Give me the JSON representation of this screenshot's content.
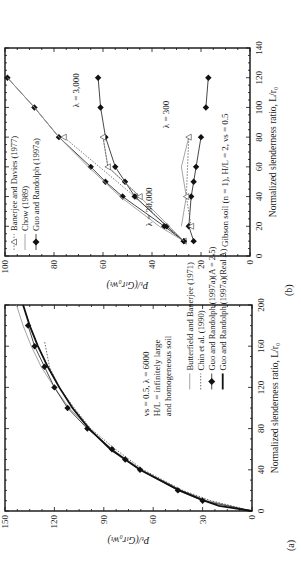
{
  "figure": {
    "panel_a_label": "(a)",
    "panel_b_label": "(b)"
  },
  "chart_data": [
    {
      "panel": "(a)",
      "type": "line",
      "title": "",
      "xlabel": "Normalized slenderness ratio, L/r0",
      "ylabel": "Pt/(GLr0wt)",
      "xlim": [
        0,
        200
      ],
      "ylim": [
        0,
        150
      ],
      "xticks": [
        0,
        40,
        80,
        120,
        160,
        200
      ],
      "yticks": [
        0,
        30,
        60,
        90,
        120,
        150
      ],
      "annotation": [
        "νs = 0.5, λ = 6000",
        "H/L = infinitely large",
        "and homogeneous soil"
      ],
      "legend_position": "lower right",
      "series": [
        {
          "name": "Butterfield and Banerjee (1971)",
          "style": "thin-gray",
          "x": [
            0,
            10,
            20,
            40,
            60,
            80,
            100,
            120,
            140,
            160,
            180,
            200
          ],
          "y": [
            0,
            27,
            43,
            67,
            85,
            99,
            111,
            120,
            128,
            134,
            139,
            143
          ]
        },
        {
          "name": "Chin et al. (1990)",
          "style": "dotted",
          "x": [
            0,
            10,
            20,
            40,
            60,
            80,
            100,
            120,
            140,
            165
          ],
          "y": [
            0,
            25,
            42,
            66,
            83,
            98,
            108,
            117,
            123,
            126
          ]
        },
        {
          "name": "Guo and Randolph (1997a)(A = 2.5)",
          "style": "line-diamond",
          "x": [
            0,
            10,
            20,
            40,
            50,
            60,
            80,
            100,
            120,
            140,
            160,
            180
          ],
          "y": [
            0,
            30,
            45,
            68,
            77,
            85,
            100,
            112,
            120,
            126,
            132,
            136
          ]
        },
        {
          "name": "Guo and Randolph (1997a)(Real A)",
          "style": "thick-black",
          "x": [
            0,
            5,
            10,
            20,
            40,
            60,
            80,
            100,
            120,
            140,
            160,
            180,
            200
          ],
          "y": [
            0,
            20,
            29,
            44,
            68,
            86,
            99,
            109,
            117,
            124,
            130,
            135,
            139
          ]
        }
      ]
    },
    {
      "panel": "(b)",
      "type": "line",
      "title": "",
      "xlabel": "Normalized slenderness ratio, L/r0",
      "ylabel": "Pt/(GLr0wt)",
      "xlim": [
        0,
        140
      ],
      "ylim": [
        0,
        100
      ],
      "xticks": [
        0,
        20,
        40,
        60,
        80,
        100,
        120,
        140
      ],
      "yticks": [
        0,
        20,
        40,
        60,
        80,
        100
      ],
      "annotation": "Gibson soil (n = 1), H/L = 2, νs = 0.5",
      "curve_labels": [
        "λ = 30,000",
        "λ = 3,000",
        "λ = 300"
      ],
      "legend_position": "upper left",
      "legend": [
        "Banerjee and Davies (1977)",
        "Chow (1989)",
        "Guo and Randolph (1997a)"
      ],
      "series": [
        {
          "name": "Guo and Randolph (1997a) λ=30,000",
          "style": "line-diamond",
          "x": [
            10,
            20,
            40,
            50,
            60,
            80,
            100,
            120
          ],
          "y": [
            27,
            35,
            52,
            59,
            65,
            78,
            88,
            99
          ]
        },
        {
          "name": "Chow (1989) λ=30,000",
          "style": "thin-gray",
          "x": [
            10,
            20,
            40,
            60,
            80,
            100,
            120
          ],
          "y": [
            27,
            37,
            53,
            66,
            78,
            88,
            99
          ]
        },
        {
          "name": "Banerjee and Davies (1977) λ=30,000",
          "style": "dotted-triangle",
          "x": [
            10,
            40,
            80
          ],
          "y": [
            27,
            47,
            76
          ]
        },
        {
          "name": "Guo and Randolph (1997a) λ=3,000",
          "style": "line-diamond",
          "x": [
            10,
            20,
            40,
            50,
            60,
            80,
            100,
            120
          ],
          "y": [
            27,
            34,
            47,
            51,
            55,
            59,
            61,
            62
          ]
        },
        {
          "name": "Chow (1989) λ=3,000",
          "style": "thin-gray",
          "x": [
            10,
            40,
            60,
            80
          ],
          "y": [
            27,
            45,
            58,
            60
          ]
        },
        {
          "name": "Banerjee and Davies (1977) λ=3,000",
          "style": "dotted-triangle",
          "x": [
            40,
            60,
            80
          ],
          "y": [
            45,
            58,
            60
          ]
        },
        {
          "name": "Guo and Randolph (1997a) λ=300",
          "style": "line-diamond",
          "x": [
            10,
            20,
            40,
            50,
            60,
            80
          ],
          "y": [
            23,
            25,
            24,
            23,
            22,
            20
          ]
        },
        {
          "name": "Guo and Randolph (1997a) λ=300 (long piles)",
          "style": "line-diamond",
          "x": [
            100,
            120
          ],
          "y": [
            18,
            17
          ]
        },
        {
          "name": "Chow (1989) λ=300",
          "style": "thin-gray",
          "x": [
            20,
            40,
            60,
            80
          ],
          "y": [
            28,
            26,
            28,
            25
          ]
        },
        {
          "name": "Banerjee and Davies (1977) λ=300",
          "style": "dotted-triangle",
          "x": [
            20,
            40,
            80
          ],
          "y": [
            24,
            26,
            25
          ]
        }
      ]
    }
  ]
}
